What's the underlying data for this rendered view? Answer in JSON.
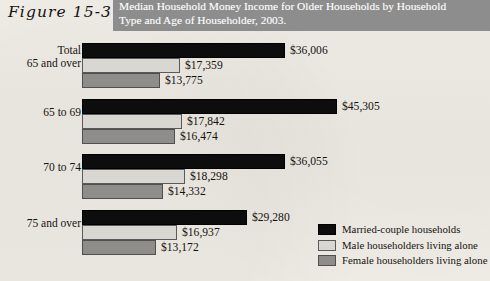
{
  "figure": {
    "label": "Figure 15-3",
    "title_line1": "Median Household Money Income for Older Households by Household",
    "title_line2": "Type and Age of Householder, 2003.",
    "banner_color": "#8d8d8d",
    "page_background": "#f2efe9"
  },
  "legend": {
    "items": [
      {
        "label": "Married-couple households",
        "color": "#0d0d0d"
      },
      {
        "label": "Male householders living alone",
        "color": "#d9d7d2"
      },
      {
        "label": "Female householders living alone",
        "color": "#8f8d89"
      }
    ]
  },
  "groups": [
    {
      "label_line1": "Total",
      "label_line2": "65 and over",
      "values": [
        "$36,006",
        "$17,359",
        "$13,775"
      ]
    },
    {
      "label_line1": "65 to 69",
      "label_line2": "",
      "values": [
        "$45,305",
        "$17,842",
        "$16,474"
      ]
    },
    {
      "label_line1": "70 to 74",
      "label_line2": "",
      "values": [
        "$36,055",
        "$18,298",
        "$14,332"
      ]
    },
    {
      "label_line1": "75 and over",
      "label_line2": "",
      "values": [
        "$29,280",
        "$16,937",
        "$13,172"
      ]
    }
  ],
  "chart_data": {
    "type": "bar",
    "orientation": "horizontal",
    "title": "Median Household Money Income for Older Households by Household Type and Age of Householder, 2003.",
    "xlabel": "",
    "ylabel": "",
    "categories": [
      "Total 65 and over",
      "65 to 69",
      "70 to 74",
      "75 and over"
    ],
    "series": [
      {
        "name": "Married-couple households",
        "color": "#0d0d0d",
        "values": [
          36006,
          45305,
          36055,
          29280
        ]
      },
      {
        "name": "Male householders living alone",
        "color": "#d9d7d2",
        "values": [
          17359,
          17842,
          18298,
          16937
        ]
      },
      {
        "name": "Female householders living alone",
        "color": "#8f8d89",
        "values": [
          13775,
          16474,
          14332,
          13172
        ]
      }
    ],
    "value_labels": [
      [
        "$36,006",
        "$17,359",
        "$13,775"
      ],
      [
        "$45,305",
        "$17,842",
        "$16,474"
      ],
      [
        "$36,055",
        "$18,298",
        "$14,332"
      ],
      [
        "$29,280",
        "$16,937",
        "$13,172"
      ]
    ],
    "xlim": [
      0,
      45305
    ],
    "grid": false,
    "legend_position": "bottom-right"
  },
  "render": {
    "axis_x_px": 82,
    "px_per_dollar": 0.005629,
    "bar_height_px": 15,
    "group_tops_px": [
      10,
      66,
      121,
      177
    ]
  }
}
